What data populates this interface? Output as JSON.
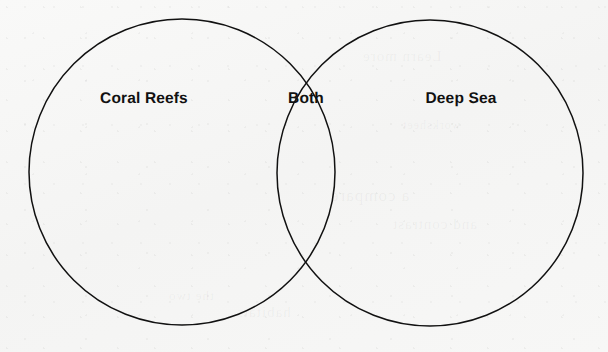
{
  "page": {
    "background_color": "#f6f6f5",
    "ink_color": "#111111",
    "width": 608,
    "height": 352
  },
  "diagram": {
    "type": "venn",
    "sets": 2,
    "stroke_color": "#111111",
    "stroke_width": 1.5,
    "fill": "none",
    "circles": [
      {
        "id": "left",
        "label": "Coral Reefs",
        "cx": 182,
        "cy": 172,
        "r": 153
      },
      {
        "id": "right",
        "label": "Deep Sea",
        "cx": 430,
        "cy": 173,
        "r": 153
      }
    ],
    "intersection": {
      "label": "Both",
      "upper_point": {
        "x": 306,
        "y": 38
      },
      "lower_point": {
        "x": 306,
        "y": 307
      }
    },
    "labels": [
      {
        "id": "left-label",
        "text": "Coral Reefs",
        "x": 144,
        "y": 99,
        "region": "left-only"
      },
      {
        "id": "both-label",
        "text": "Both",
        "x": 306,
        "y": 99,
        "region": "intersection"
      },
      {
        "id": "right-label",
        "text": "Deep Sea",
        "x": 461,
        "y": 99,
        "region": "right-only"
      }
    ]
  },
  "background_bleed": {
    "note": "faint illegible show-through from reverse side of the page",
    "marks": [
      "Learn more",
      "a compare",
      "and contrast",
      "the two",
      "habitats",
      "worksheet"
    ]
  }
}
